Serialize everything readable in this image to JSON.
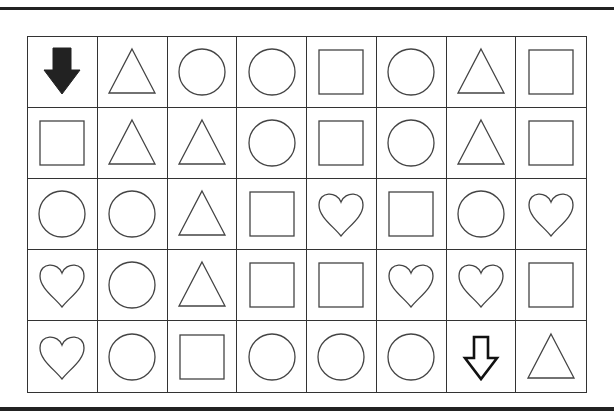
{
  "puzzle": {
    "type": "shape-maze-grid",
    "rows": 5,
    "columns": 8,
    "start_marker": "arrow-down-filled",
    "end_marker": "arrow-down-outline",
    "cells": [
      [
        "arrow-down-filled",
        "triangle",
        "circle",
        "circle",
        "square",
        "circle",
        "triangle",
        "square"
      ],
      [
        "square",
        "triangle",
        "triangle",
        "circle",
        "square",
        "circle",
        "triangle",
        "square"
      ],
      [
        "circle",
        "circle",
        "triangle",
        "square",
        "heart",
        "square",
        "circle",
        "heart"
      ],
      [
        "heart",
        "circle",
        "triangle",
        "square",
        "square",
        "heart",
        "heart",
        "square"
      ],
      [
        "heart",
        "circle",
        "square",
        "circle",
        "circle",
        "circle",
        "arrow-down-outline",
        "triangle"
      ]
    ]
  },
  "colors": {
    "line": "#333333",
    "fill_arrow": "#222222",
    "background": "#ffffff"
  }
}
